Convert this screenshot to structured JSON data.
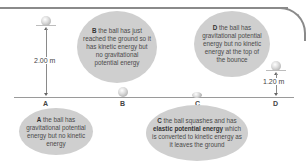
{
  "diagram": {
    "points": [
      {
        "id": "A",
        "label": "A"
      },
      {
        "id": "B",
        "label": "B"
      },
      {
        "id": "C",
        "label": "C"
      },
      {
        "id": "D",
        "label": "D"
      }
    ],
    "measurements": {
      "drop_height": "2.00 m",
      "bounce_height": "1.20 m"
    },
    "bubbles": {
      "A": {
        "key": "A",
        "text": " the ball has gravitational potential energy but no kinetic energy"
      },
      "B": {
        "key": "B",
        "text": " the ball has just reached the ground so it has kinetic energy but no gravitational potential energy"
      },
      "C": {
        "key": "C",
        "text_before": " the ball squashes and has ",
        "bold": "elastic potential energy",
        "text_after": " which is converted to kinetic energy as it leaves the ground"
      },
      "D": {
        "key": "D",
        "text": " the ball has gravitational potential energy but no kinetic energy at the top of the bounce"
      }
    },
    "colors": {
      "bubble_fill": "#cfcfcf",
      "frame": "#8a8a8a",
      "ground_line": "#9a9a9a"
    }
  }
}
